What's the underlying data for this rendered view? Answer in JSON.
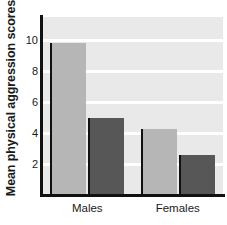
{
  "chart_data": {
    "type": "bar",
    "title": "",
    "subtitle": "",
    "xlabel": "",
    "ylabel": "Mean physical aggression scores",
    "categories": [
      "Males",
      "Females"
    ],
    "series": [
      {
        "name": "series-light",
        "color": "#b6b6b6",
        "values": [
          9.8,
          4.25
        ]
      },
      {
        "name": "series-dark",
        "color": "#575757",
        "values": [
          5.0,
          2.6
        ]
      }
    ],
    "yticks": [
      2,
      4,
      6,
      8,
      10
    ],
    "ytick_labels": [
      "2",
      "4",
      "6",
      "8",
      "10"
    ],
    "ylim": [
      0,
      11.5
    ],
    "grid": "horizontal-white",
    "legend": "none",
    "annotations": []
  },
  "colors": {
    "plot_background": "#e9e9e9",
    "gridline": "#ffffff",
    "axis": "#111111",
    "text": "#1a1a1a",
    "bar_light": "#b6b6b6",
    "bar_dark": "#575757"
  }
}
